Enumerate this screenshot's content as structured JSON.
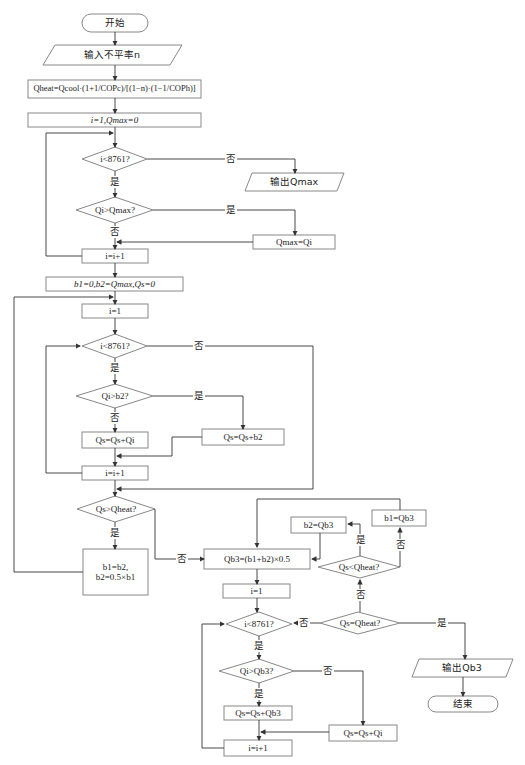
{
  "flowchart": {
    "start": "开始",
    "input": "输入不平率n",
    "formula": "Qheat=Qcool·(1+1/COPc)/[(1−n)·(1−1/COPh)]",
    "init1": "i=1,Qmax=0",
    "loop1_cond": "i<8761?",
    "output_qmax": "输出Qmax",
    "cmp1_cond": "Qi>Qmax?",
    "assign_qmax": "Qmax=Qi",
    "inc1": "i=i+1",
    "init2": "b1=0,b2=Qmax,Qs=0",
    "init_i2": "i=1",
    "loop2_cond": "i<8761?",
    "cmp2_cond": "Qi>b2?",
    "add_qi": "Qs=Qs+Qi",
    "add_b2": "Qs=Qs+b2",
    "inc2": "i=i+1",
    "cmp_heat": "Qs>Qheat?",
    "update_b": "b1=b2, b2=0.5×b1",
    "bisect": "Qb3=(b1+b2)×0.5",
    "init_i3": "i=1",
    "loop3_cond": "i<8761?",
    "cmp3_cond": "Qi>Qb3?",
    "add_qb3": "Qs=Qs+Qb3",
    "add_qi3": "Qs=Qs+Qi",
    "inc3": "i=i+1",
    "eq_cond": "Qs=Qheat?",
    "lt_cond": "Qs<Qheat?",
    "set_b2": "b2=Qb3",
    "set_b1": "b1=Qb3",
    "output_qb3": "输出Qb3",
    "end": "结束",
    "labels": {
      "yes": "是",
      "no": "否"
    }
  }
}
